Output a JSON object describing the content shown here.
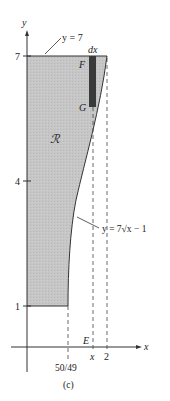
{
  "figure": {
    "caption": "(c)",
    "region_label": "ℛ",
    "axes": {
      "x_label": "x",
      "y_label": "y",
      "y_ticks": [
        {
          "value": 7,
          "label": "7"
        },
        {
          "value": 4,
          "label": "4"
        },
        {
          "value": 1,
          "label": "1"
        }
      ],
      "x_ticks": [
        {
          "value": "50/49",
          "label": "50/49"
        },
        {
          "value": "x",
          "label": "x"
        },
        {
          "value": 2,
          "label": "2"
        }
      ]
    },
    "curves": {
      "top_line": "y = 7",
      "bottom_curve": "y = 7√x − 1"
    },
    "strip": {
      "width_label": "dx",
      "top_point": "F",
      "bottom_point": "G",
      "axis_point": "E"
    },
    "colors": {
      "region_fill": "#c6c6c6",
      "strip_fill": "#3a3a3a",
      "line": "#333333"
    }
  }
}
